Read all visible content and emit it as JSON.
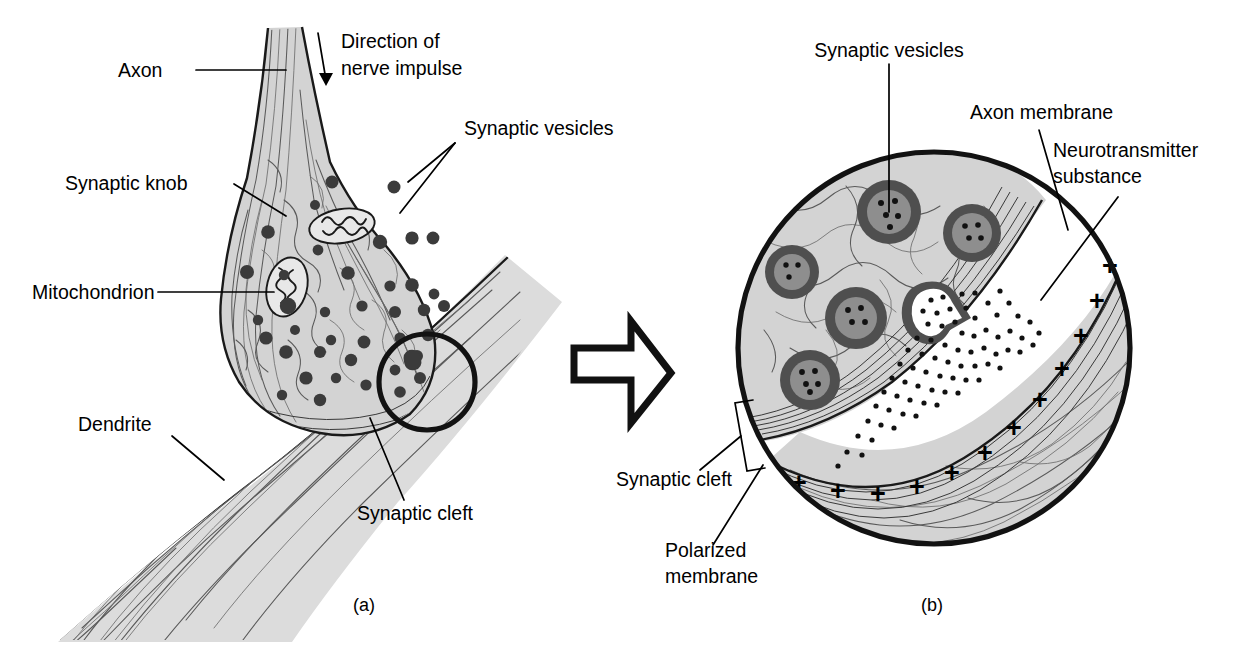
{
  "figure": {
    "background_color": "#ffffff",
    "cytoplasm_fill": "#d3d3d3",
    "dendrite_fill": "#dcdcdc",
    "vesicle_ring_color": "#4f4f4f",
    "vesicle_core_color": "#8e8e8e",
    "ink_color": "#111111"
  },
  "panel_a": {
    "caption": "(a)",
    "labels": [
      {
        "id": "axon",
        "text": "Axon"
      },
      {
        "id": "direction",
        "line1": "Direction of",
        "line2": "nerve impulse"
      },
      {
        "id": "synaptic-vesicles",
        "text": "Synaptic vesicles"
      },
      {
        "id": "synaptic-knob",
        "text": "Synaptic knob"
      },
      {
        "id": "mitochondrion",
        "text": "Mitochondrion"
      },
      {
        "id": "dendrite",
        "text": "Dendrite"
      },
      {
        "id": "synaptic-cleft",
        "text": "Synaptic cleft"
      }
    ],
    "vesicle_count": 34,
    "mitochondria_count": 2,
    "magnifier_circle": {
      "cx": 427,
      "cy": 382,
      "r": 48
    }
  },
  "connector": {
    "id": "magnify-arrow",
    "direction": "right",
    "style": "hollow-outline"
  },
  "panel_b": {
    "caption": "(b)",
    "labels": [
      {
        "id": "synaptic-vesicles",
        "text": "Synaptic vesicles"
      },
      {
        "id": "axon-membrane",
        "text": "Axon membrane"
      },
      {
        "id": "neurotransmitter",
        "line1": "Neurotransmitter",
        "line2": "substance"
      },
      {
        "id": "synaptic-cleft",
        "text": "Synaptic cleft"
      },
      {
        "id": "polarized-membrane",
        "line1": "Polarized",
        "line2": "membrane"
      }
    ],
    "circle": {
      "cx": 934,
      "cy": 348,
      "r": 198
    },
    "vesicle_count": 6,
    "fusing_vesicle_count": 1,
    "charge_symbol": "+",
    "charge_symbol_count": 12,
    "neurotransmitter_dot_count": 74
  }
}
